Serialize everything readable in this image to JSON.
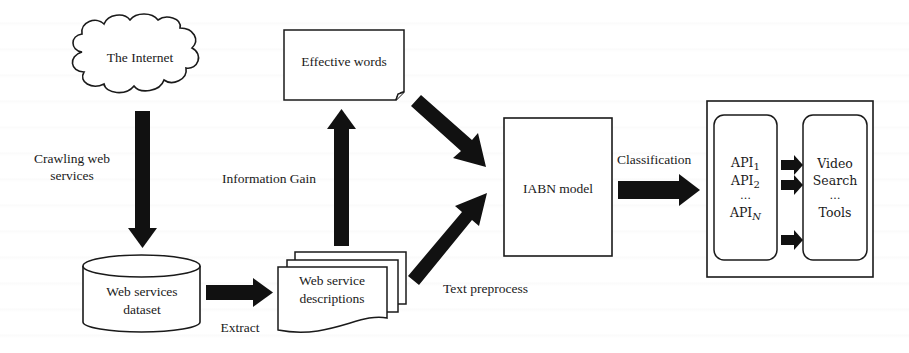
{
  "diagram": {
    "title": "",
    "nodes": {
      "internet": {
        "label": "The Internet",
        "shape": "cloud"
      },
      "dataset": {
        "label_line1": "Web services",
        "label_line2": "dataset",
        "shape": "cylinder"
      },
      "descriptions": {
        "label_line1": "Web service",
        "label_line2": "descriptions",
        "shape": "multi-document"
      },
      "effective_words": {
        "label": "Effective words",
        "shape": "document-folded-corner"
      },
      "iabn": {
        "label": "IABN model",
        "shape": "rectangle"
      },
      "apis": {
        "shape": "rounded-rectangle",
        "items": [
          {
            "base": "API",
            "sub": "1"
          },
          {
            "base": "API",
            "sub": "2"
          },
          {
            "base": "…",
            "sub": ""
          },
          {
            "base": "API",
            "sub": "N"
          }
        ]
      },
      "categories": {
        "shape": "rounded-rectangle",
        "items": [
          "Video",
          "Search",
          "…",
          "Tools"
        ]
      }
    },
    "edges": {
      "crawl": {
        "label_line1": "Crawling web",
        "label_line2": "services",
        "from": "internet",
        "to": "dataset"
      },
      "extract": {
        "label": "Extract",
        "from": "dataset",
        "to": "descriptions"
      },
      "info_gain": {
        "label": "Information Gain",
        "from": "descriptions",
        "to": "effective_words"
      },
      "words_to_model": {
        "label": "",
        "from": "effective_words",
        "to": "iabn"
      },
      "preprocess": {
        "label": "Text preprocess",
        "from": "descriptions",
        "to": "iabn"
      },
      "classification": {
        "label": "Classification",
        "from": "iabn",
        "to": "apis"
      }
    },
    "colors": {
      "stroke": "#1a1a1a",
      "arrow_fill": "#111111",
      "background": "#ffffff"
    }
  }
}
